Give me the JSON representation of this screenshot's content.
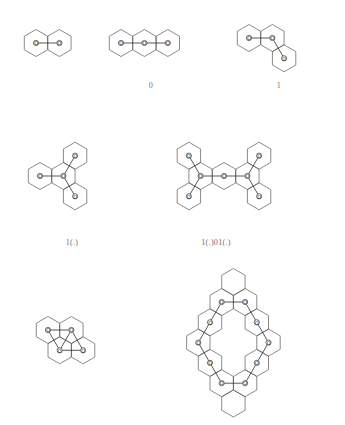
{
  "figure": {
    "title": "",
    "background_color": "#ffffff",
    "hex_stroke_color": "#595959",
    "bond_stroke_color": "#2e2e2e",
    "node_fill_color": "#ffffff",
    "node_label_color": "#1d1d1d",
    "caption_color": "#6e6e6e",
    "node_label_text": "O",
    "node_radius": 2.6,
    "hex_radius": 13.5
  },
  "structures": [
    {
      "id": "structure-1",
      "name": "two-ring-linear",
      "caption": "",
      "caption_x": 62,
      "caption_y": 84,
      "origin_x": 12,
      "origin_y": 12,
      "width": 96,
      "height": 62,
      "hex_centers": [
        {
          "x": 24,
          "y": 31
        },
        {
          "x": 47.4,
          "y": 31
        }
      ],
      "nodes": [
        {
          "x": 24,
          "y": 31,
          "label": "O"
        },
        {
          "x": 47.4,
          "y": 31,
          "label": "O"
        }
      ],
      "bonds": [
        {
          "from": 0,
          "to": 1
        }
      ]
    },
    {
      "id": "structure-2",
      "name": "three-ring-linear",
      "caption": "0",
      "caption_x": 151,
      "caption_y": 81,
      "origin_x": 105,
      "origin_y": 12,
      "width": 105,
      "height": 62,
      "hex_centers": [
        {
          "x": 16,
          "y": 31
        },
        {
          "x": 39.4,
          "y": 31
        },
        {
          "x": 62.8,
          "y": 31
        }
      ],
      "nodes": [
        {
          "x": 16,
          "y": 31,
          "label": "O"
        },
        {
          "x": 39.4,
          "y": 31,
          "label": "O"
        },
        {
          "x": 62.8,
          "y": 31,
          "label": "O"
        }
      ],
      "bonds": [
        {
          "from": 0,
          "to": 1
        },
        {
          "from": 1,
          "to": 2
        }
      ]
    },
    {
      "id": "structure-3",
      "name": "three-ring-angular",
      "caption": "1",
      "caption_x": 279,
      "caption_y": 81,
      "origin_x": 233,
      "origin_y": 10,
      "width": 105,
      "height": 78,
      "hex_centers": [
        {
          "x": 16,
          "y": 28
        },
        {
          "x": 39.4,
          "y": 28
        },
        {
          "x": 51.1,
          "y": 48.3
        }
      ],
      "nodes": [
        {
          "x": 16,
          "y": 28,
          "label": "O"
        },
        {
          "x": 39.4,
          "y": 28,
          "label": "O"
        },
        {
          "x": 51.1,
          "y": 48.3,
          "label": "O"
        }
      ],
      "bonds": [
        {
          "from": 0,
          "to": 1
        },
        {
          "from": 1,
          "to": 2
        }
      ]
    },
    {
      "id": "structure-4",
      "name": "four-ring-branched",
      "caption": "1(.)",
      "caption_x": 72,
      "caption_y": 238,
      "origin_x": 24,
      "origin_y": 126,
      "width": 105,
      "height": 100,
      "hex_centers": [
        {
          "x": 16,
          "y": 50
        },
        {
          "x": 39.4,
          "y": 50
        },
        {
          "x": 51.1,
          "y": 29.7
        },
        {
          "x": 51.1,
          "y": 70.3
        }
      ],
      "nodes": [
        {
          "x": 16,
          "y": 50,
          "label": "O"
        },
        {
          "x": 39.4,
          "y": 50,
          "label": "O"
        },
        {
          "x": 51.1,
          "y": 29.7,
          "label": "O"
        },
        {
          "x": 51.1,
          "y": 70.3,
          "label": "O"
        }
      ],
      "bonds": [
        {
          "from": 0,
          "to": 1
        },
        {
          "from": 1,
          "to": 2
        },
        {
          "from": 1,
          "to": 3
        }
      ]
    },
    {
      "id": "structure-5",
      "name": "seven-ring-symmetric",
      "caption": "1(.)01(.)",
      "caption_x": 216,
      "caption_y": 238,
      "origin_x": 150,
      "origin_y": 126,
      "width": 150,
      "height": 100,
      "hex_centers": [
        {
          "x": 74,
          "y": 50
        },
        {
          "x": 50.6,
          "y": 50
        },
        {
          "x": 97.4,
          "y": 50
        },
        {
          "x": 38.9,
          "y": 29.7
        },
        {
          "x": 38.9,
          "y": 70.3
        },
        {
          "x": 109.1,
          "y": 29.7
        },
        {
          "x": 109.1,
          "y": 70.3
        }
      ],
      "nodes": [
        {
          "x": 74,
          "y": 50,
          "label": "O"
        },
        {
          "x": 50.6,
          "y": 50,
          "label": "O"
        },
        {
          "x": 97.4,
          "y": 50,
          "label": "O"
        },
        {
          "x": 38.9,
          "y": 29.7,
          "label": "O"
        },
        {
          "x": 38.9,
          "y": 70.3,
          "label": "O"
        },
        {
          "x": 109.1,
          "y": 29.7,
          "label": "O"
        },
        {
          "x": 109.1,
          "y": 70.3,
          "label": "O"
        }
      ],
      "bonds": [
        {
          "from": 0,
          "to": 1
        },
        {
          "from": 0,
          "to": 2
        },
        {
          "from": 1,
          "to": 3
        },
        {
          "from": 1,
          "to": 4
        },
        {
          "from": 2,
          "to": 5
        },
        {
          "from": 2,
          "to": 6
        }
      ]
    },
    {
      "id": "structure-6",
      "name": "four-ring-cycle",
      "caption": "",
      "caption_x": 76,
      "caption_y": 392,
      "origin_x": 28,
      "origin_y": 300,
      "width": 100,
      "height": 90,
      "hex_centers": [
        {
          "x": 20,
          "y": 30
        },
        {
          "x": 43.4,
          "y": 30
        },
        {
          "x": 31.7,
          "y": 50.3
        },
        {
          "x": 55.1,
          "y": 50.3
        }
      ],
      "nodes": [
        {
          "x": 20,
          "y": 30,
          "label": "O"
        },
        {
          "x": 43.4,
          "y": 30,
          "label": "O"
        },
        {
          "x": 31.7,
          "y": 50.3,
          "label": "O"
        },
        {
          "x": 55.1,
          "y": 50.3,
          "label": "O"
        }
      ],
      "bonds": [
        {
          "from": 0,
          "to": 1
        },
        {
          "from": 0,
          "to": 2
        },
        {
          "from": 1,
          "to": 2
        },
        {
          "from": 1,
          "to": 3
        },
        {
          "from": 2,
          "to": 3
        }
      ]
    },
    {
      "id": "structure-7",
      "name": "twelve-ring-macrocycle",
      "caption": "",
      "caption_x": 232,
      "caption_y": 418,
      "origin_x": 172,
      "origin_y": 282,
      "width": 122,
      "height": 140,
      "hex_centers": [
        {
          "x": 49.7,
          "y": 20
        },
        {
          "x": 73.1,
          "y": 20
        },
        {
          "x": 38,
          "y": 40.3
        },
        {
          "x": 84.8,
          "y": 40.3
        },
        {
          "x": 26.3,
          "y": 60.6
        },
        {
          "x": 96.5,
          "y": 60.6
        },
        {
          "x": 38,
          "y": 80.9
        },
        {
          "x": 84.8,
          "y": 80.9
        },
        {
          "x": 49.7,
          "y": 101.2
        },
        {
          "x": 73.1,
          "y": 101.2
        },
        {
          "x": 61.4,
          "y": 121.5
        },
        {
          "x": 61.4,
          "y": 0
        }
      ],
      "nodes": [
        {
          "x": 49.7,
          "y": 20,
          "label": "O"
        },
        {
          "x": 73.1,
          "y": 20,
          "label": "O"
        },
        {
          "x": 38,
          "y": 40.3,
          "label": "O"
        },
        {
          "x": 84.8,
          "y": 40.3,
          "label": "O"
        },
        {
          "x": 26.3,
          "y": 60.6,
          "label": "O"
        },
        {
          "x": 96.5,
          "y": 60.6,
          "label": "O"
        },
        {
          "x": 38,
          "y": 80.9,
          "label": "O"
        },
        {
          "x": 84.8,
          "y": 80.9,
          "label": "O"
        },
        {
          "x": 49.7,
          "y": 101.2,
          "label": "O"
        },
        {
          "x": 73.1,
          "y": 101.2,
          "label": "O"
        }
      ],
      "bonds": [
        {
          "from": 0,
          "to": 1
        },
        {
          "from": 0,
          "to": 2
        },
        {
          "from": 1,
          "to": 3
        },
        {
          "from": 2,
          "to": 4
        },
        {
          "from": 3,
          "to": 5
        },
        {
          "from": 4,
          "to": 6
        },
        {
          "from": 5,
          "to": 7
        },
        {
          "from": 6,
          "to": 8
        },
        {
          "from": 7,
          "to": 9
        },
        {
          "from": 8,
          "to": 9
        }
      ]
    }
  ]
}
